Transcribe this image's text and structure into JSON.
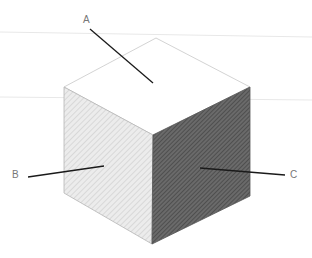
{
  "diagram": {
    "labels": [
      {
        "id": "A",
        "text": "A",
        "face": "top",
        "x": 83,
        "y": 15
      },
      {
        "id": "B",
        "text": "B",
        "face": "left",
        "x": 12,
        "y": 170
      },
      {
        "id": "C",
        "text": "C",
        "face": "right",
        "x": 290,
        "y": 170
      }
    ],
    "leaders": [
      {
        "id": "A",
        "x1": 90,
        "y1": 29,
        "x2": 153,
        "y2": 83
      },
      {
        "id": "B",
        "x1": 28,
        "y1": 177,
        "x2": 104,
        "y2": 166
      },
      {
        "id": "C",
        "x1": 200,
        "y1": 168,
        "x2": 285,
        "y2": 175
      }
    ],
    "colors": {
      "top_face": "#ffffff",
      "left_face": "#e6e6e6",
      "right_face": "#5a5a5a",
      "edge": "#b5b5b5",
      "leader": "#1a1a1a",
      "label": "#777777",
      "guide": "#e8e8e8"
    }
  }
}
